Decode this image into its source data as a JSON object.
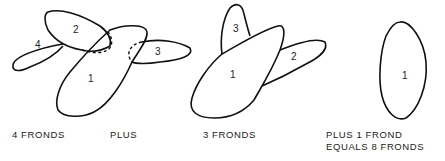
{
  "diagram": {
    "groups": [
      {
        "caption": "4 FRONDS",
        "fronds": [
          "1",
          "2",
          "3",
          "4"
        ]
      },
      {
        "caption": "PLUS"
      },
      {
        "caption": "3 FRONDS",
        "fronds": [
          "1",
          "2",
          "3"
        ]
      },
      {
        "caption_line1": "PLUS 1 FROND",
        "caption_line2": "EQUALS 8 FRONDS",
        "fronds": [
          "1"
        ]
      }
    ],
    "colors": {
      "stroke": "#111111",
      "background": "#ffffff"
    }
  }
}
